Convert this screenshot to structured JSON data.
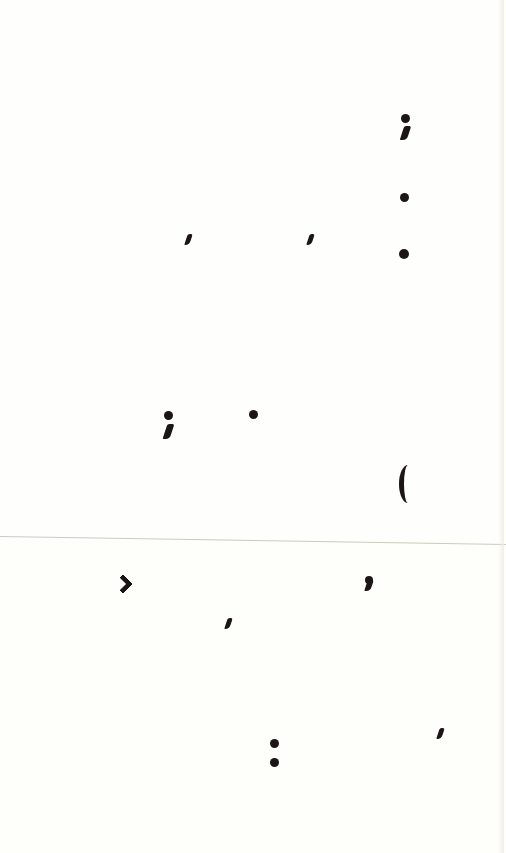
{
  "page": {
    "background_color": "#fefefb",
    "ink_color": "#1b1515",
    "fold_line_color": "#cfcac0"
  },
  "marks": [
    {
      "glyph": ";",
      "name": "semicolon",
      "x": 405,
      "y": 118
    },
    {
      "glyph": ".",
      "name": "period",
      "x": 405,
      "y": 198
    },
    {
      "glyph": ",",
      "name": "comma",
      "x": 188,
      "y": 240
    },
    {
      "glyph": ",",
      "name": "comma",
      "x": 310,
      "y": 240
    },
    {
      "glyph": ".",
      "name": "period",
      "x": 404,
      "y": 254
    },
    {
      "glyph": ";",
      "name": "semicolon",
      "x": 169,
      "y": 416
    },
    {
      "glyph": ".",
      "name": "period",
      "x": 254,
      "y": 415
    },
    {
      "glyph": "(",
      "name": "open-parenthesis",
      "x": 404,
      "y": 484
    },
    {
      "glyph": "›",
      "name": "chevron",
      "x": 124,
      "y": 582
    },
    {
      "glyph": ",",
      "name": "comma",
      "x": 368,
      "y": 584
    },
    {
      "glyph": ",",
      "name": "comma",
      "x": 228,
      "y": 624
    },
    {
      "glyph": ",",
      "name": "comma",
      "x": 440,
      "y": 734
    },
    {
      "glyph": ":",
      "name": "colon",
      "x": 275,
      "y": 753
    }
  ]
}
